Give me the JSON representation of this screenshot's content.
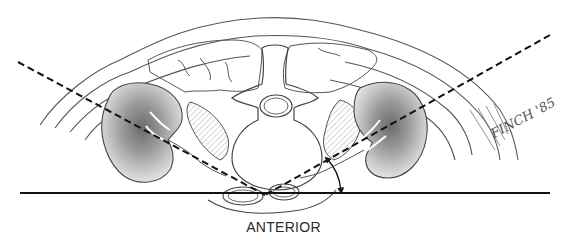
{
  "figure": {
    "labels": {
      "orientation": "ANTERIOR",
      "signature": "FINCH '85"
    },
    "colors": {
      "line": "#1a1a1a",
      "outline": "#444444",
      "hatch": "#888888",
      "background": "#ffffff"
    }
  }
}
